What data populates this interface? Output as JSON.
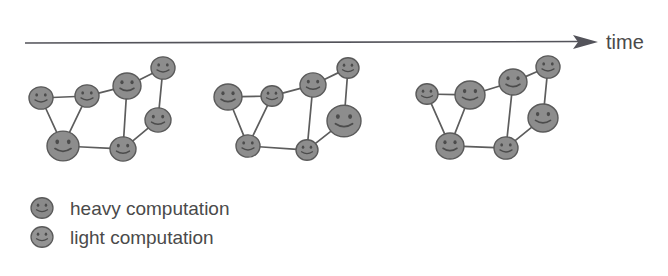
{
  "figure": {
    "title_text": "",
    "background_color": "#ffffff",
    "node_fill_color": "#8d8d8d",
    "node_stroke_color": "#5a5a5a",
    "edge_color": "#5d5d5d",
    "text_color": "#4a4a4a"
  },
  "axis": {
    "label": "time",
    "label_x": 606,
    "label_y": 48,
    "line_x1": 25,
    "line_x2": 578,
    "line_y": 42,
    "arrow_tip_x": 598,
    "direction": "left-to-right"
  },
  "legend": {
    "items": [
      {
        "label": "heavy computation",
        "marker": "heavy-node-circle",
        "marker_x": 42,
        "marker_y": 208,
        "marker_r": 11,
        "fill": "#8a8a8a",
        "label_x": 70,
        "label_y": 215
      },
      {
        "label": "light computation",
        "marker": "light-node-circle",
        "marker_x": 42,
        "marker_y": 237,
        "marker_r": 11,
        "fill": "#949494",
        "label_x": 70,
        "label_y": 244
      }
    ]
  },
  "graphs": [
    {
      "name": "cluster-t1",
      "caption": "",
      "nodes": [
        {
          "id": "a",
          "x": 41,
          "y": 98,
          "r": 12,
          "load": "light"
        },
        {
          "id": "b",
          "x": 87,
          "y": 96,
          "r": 12,
          "load": "light"
        },
        {
          "id": "c",
          "x": 63,
          "y": 146,
          "r": 16,
          "load": "heavy"
        },
        {
          "id": "d",
          "x": 127,
          "y": 86,
          "r": 14,
          "load": "heavy"
        },
        {
          "id": "e",
          "x": 163,
          "y": 68,
          "r": 12,
          "load": "light"
        },
        {
          "id": "f",
          "x": 158,
          "y": 120,
          "r": 13,
          "load": "light"
        },
        {
          "id": "g",
          "x": 123,
          "y": 149,
          "r": 13,
          "load": "light"
        }
      ],
      "edges": [
        [
          "a",
          "b"
        ],
        [
          "a",
          "c"
        ],
        [
          "b",
          "c"
        ],
        [
          "b",
          "d"
        ],
        [
          "d",
          "e"
        ],
        [
          "d",
          "g"
        ],
        [
          "e",
          "f"
        ],
        [
          "f",
          "g"
        ],
        [
          "c",
          "g"
        ]
      ]
    },
    {
      "name": "cluster-t2",
      "caption": "",
      "nodes": [
        {
          "id": "a",
          "x": 228,
          "y": 97,
          "r": 14,
          "load": "heavy"
        },
        {
          "id": "b",
          "x": 272,
          "y": 96,
          "r": 11,
          "load": "light"
        },
        {
          "id": "c",
          "x": 248,
          "y": 146,
          "r": 12,
          "load": "light"
        },
        {
          "id": "d",
          "x": 313,
          "y": 85,
          "r": 13,
          "load": "light"
        },
        {
          "id": "e",
          "x": 348,
          "y": 68,
          "r": 11,
          "load": "light"
        },
        {
          "id": "f",
          "x": 344,
          "y": 121,
          "r": 17,
          "load": "heavy"
        },
        {
          "id": "g",
          "x": 307,
          "y": 150,
          "r": 11,
          "load": "light"
        }
      ],
      "edges": [
        [
          "a",
          "b"
        ],
        [
          "a",
          "c"
        ],
        [
          "b",
          "c"
        ],
        [
          "b",
          "d"
        ],
        [
          "d",
          "e"
        ],
        [
          "d",
          "g"
        ],
        [
          "e",
          "f"
        ],
        [
          "f",
          "g"
        ],
        [
          "c",
          "g"
        ]
      ]
    },
    {
      "name": "cluster-t3",
      "caption": "",
      "nodes": [
        {
          "id": "a",
          "x": 427,
          "y": 94,
          "r": 11,
          "load": "light"
        },
        {
          "id": "b",
          "x": 470,
          "y": 95,
          "r": 15,
          "load": "heavy"
        },
        {
          "id": "c",
          "x": 450,
          "y": 146,
          "r": 14,
          "load": "heavy"
        },
        {
          "id": "d",
          "x": 513,
          "y": 82,
          "r": 14,
          "load": "heavy"
        },
        {
          "id": "e",
          "x": 548,
          "y": 67,
          "r": 12,
          "load": "light"
        },
        {
          "id": "f",
          "x": 543,
          "y": 118,
          "r": 15,
          "load": "heavy"
        },
        {
          "id": "g",
          "x": 506,
          "y": 148,
          "r": 12,
          "load": "light"
        }
      ],
      "edges": [
        [
          "a",
          "b"
        ],
        [
          "a",
          "c"
        ],
        [
          "b",
          "c"
        ],
        [
          "b",
          "d"
        ],
        [
          "d",
          "e"
        ],
        [
          "d",
          "g"
        ],
        [
          "e",
          "f"
        ],
        [
          "f",
          "g"
        ],
        [
          "c",
          "g"
        ]
      ]
    }
  ]
}
